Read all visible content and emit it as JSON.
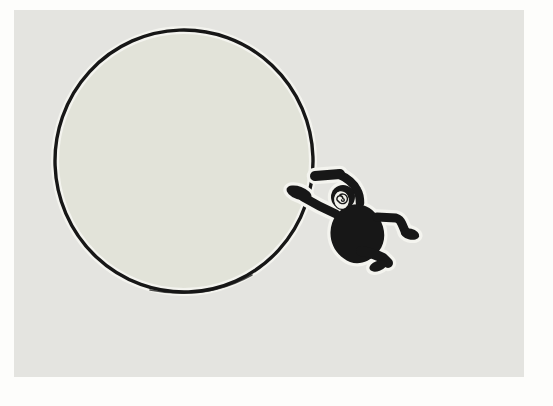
{
  "scene": {
    "title": "Monkey clinging to a giant balloon-like circle",
    "description": "Hand-drawn cartoon illustration on a pale gray canvas with a white page margin: a large circle with a dark ink outline fills the left two-thirds; a black monkey silhouette with a white spiral face clings to the circle's right edge, one arm raised overhead, one arm gripping the rim, both legs bent and trailing to the lower right.",
    "objects": [
      {
        "name": "balloon-circle",
        "description": "large hand-drawn circle, pale greenish-gray fill, black wobbly outline with white halo"
      },
      {
        "name": "monkey",
        "description": "black monkey silhouette: round body, raised arm with club-like hand, gripping arm with mitten paw on circle rim, white oval face containing a black spiral eye, two bent legs with mitten feet"
      }
    ]
  },
  "palette": {
    "page_margin": "#fdfdfb",
    "canvas": "#e4e4e0",
    "canvas_lo": "#e1e1dc",
    "circle_fill": "#e2e3d9",
    "ink": "#171717",
    "halo": "#f4f4ef",
    "face": "#f2f2ec"
  }
}
